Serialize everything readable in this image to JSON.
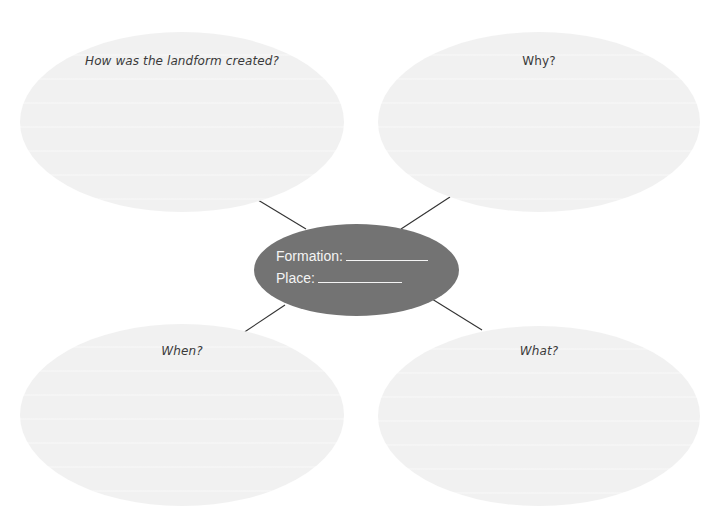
{
  "diagram": {
    "type": "concept-map",
    "center": {
      "formation_label": "Formation:",
      "place_label": "Place:",
      "fill_color": "#737373",
      "text_color": "#f4f4f4"
    },
    "bubbles": [
      {
        "id": "how",
        "prompt": "How was the landform created?"
      },
      {
        "id": "why",
        "prompt": "Why?"
      },
      {
        "id": "when",
        "prompt": "When?"
      },
      {
        "id": "what",
        "prompt": "What?"
      }
    ],
    "colors": {
      "bubble_fill": "#f1f1f1",
      "connector": "#333333",
      "background": "#ffffff"
    }
  }
}
